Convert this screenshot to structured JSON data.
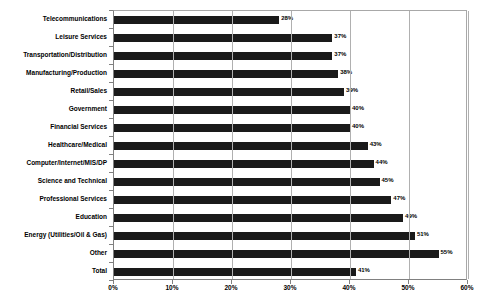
{
  "chart_data": {
    "type": "bar",
    "orientation": "horizontal",
    "title": "",
    "subtitle": "",
    "xlabel": "",
    "ylabel": "",
    "xlim": [
      0,
      60
    ],
    "ylim": null,
    "grid": true,
    "legend": null,
    "legend_position": "none",
    "xticks": [
      "0%",
      "10%",
      "20%",
      "30%",
      "40%",
      "50%",
      "60%"
    ],
    "xtick_values": [
      0,
      10,
      20,
      30,
      40,
      50,
      60
    ],
    "categories": [
      "Telecommunications",
      "Leisure Services",
      "Transportation/Distribution",
      "Manufacturing/Production",
      "Retail/Sales",
      "Government",
      "Financial Services",
      "Healthcare/Medical",
      "Computer/Internet/MIS/DP",
      "Science and Technical",
      "Professional Services",
      "Education",
      "Energy (Utilities/Oil & Gas)",
      "Other",
      "Total"
    ],
    "values": [
      28,
      37,
      37,
      38,
      39,
      40,
      40,
      43,
      44,
      45,
      47,
      49,
      51,
      55,
      41
    ],
    "data_labels": [
      "28%",
      "37%",
      "37%",
      "38%",
      "39%",
      "40%",
      "40%",
      "43%",
      "44%",
      "45%",
      "47%",
      "49%",
      "51%",
      "55%",
      "41%"
    ],
    "bar_color": "#1a1a1a",
    "background_color": "#ffffff",
    "gridline_color": "#b0b0b0",
    "axis_color": "#808080"
  }
}
